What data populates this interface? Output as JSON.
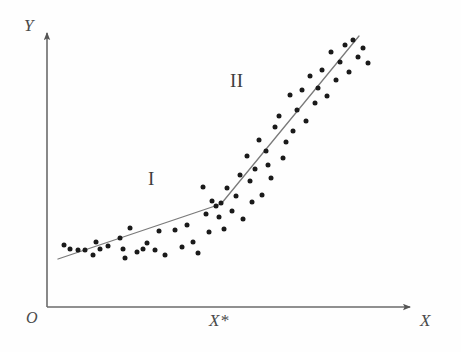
{
  "figure": {
    "background_color": "#fefefe",
    "ink_color": "#3d3d3d",
    "point_color": "#1a1a1a",
    "line_color": "#7a7a7a",
    "axis_color": "#6b6b6b"
  },
  "axes": {
    "y_label": "Y",
    "x_label": "X",
    "origin_label": "O",
    "breakpoint_label": "X*",
    "origin_px": {
      "x": 47,
      "y": 307
    },
    "x_axis_end_px": {
      "x": 415,
      "y": 307
    },
    "y_axis_top_px": {
      "x": 47,
      "y": 28
    }
  },
  "regions": {
    "first": {
      "label": "I",
      "x": 152,
      "y": 180
    },
    "second": {
      "label": "II",
      "x": 237,
      "y": 82
    }
  },
  "chart_data": {
    "type": "scatter",
    "xlabel": "X",
    "ylabel": "Y",
    "grid": false,
    "legend": false,
    "axis_style": "arrow-axes-from-origin",
    "annotations": [
      {
        "text": "I",
        "x": 152,
        "y": 180,
        "meaning": "regime-one-shallow-slope"
      },
      {
        "text": "II",
        "x": 237,
        "y": 82,
        "meaning": "regime-two-steep-slope"
      },
      {
        "text": "X*",
        "x": 219,
        "y": 318,
        "meaning": "breakpoint-on-x-axis"
      }
    ],
    "fit_line": {
      "type": "piecewise-linear",
      "breakpoint_px": {
        "x": 221,
        "y": 204
      },
      "segments": [
        {
          "name": "I",
          "from_px": {
            "x": 58,
            "y": 259
          },
          "to_px": {
            "x": 221,
            "y": 204
          },
          "slope_sign": "shallow-positive"
        },
        {
          "name": "II",
          "from_px": {
            "x": 221,
            "y": 204
          },
          "to_px": {
            "x": 359,
            "y": 36
          },
          "slope_sign": "steep-positive"
        }
      ]
    },
    "points_px": [
      [
        64,
        245
      ],
      [
        70,
        249
      ],
      [
        78,
        250
      ],
      [
        85,
        250
      ],
      [
        93,
        255
      ],
      [
        96,
        242
      ],
      [
        100,
        249
      ],
      [
        108,
        246
      ],
      [
        120,
        238
      ],
      [
        123,
        249
      ],
      [
        125,
        258
      ],
      [
        130,
        228
      ],
      [
        137,
        252
      ],
      [
        143,
        249
      ],
      [
        147,
        243
      ],
      [
        155,
        250
      ],
      [
        159,
        231
      ],
      [
        165,
        255
      ],
      [
        175,
        230
      ],
      [
        182,
        247
      ],
      [
        187,
        225
      ],
      [
        193,
        242
      ],
      [
        198,
        253
      ],
      [
        203,
        187
      ],
      [
        206,
        214
      ],
      [
        209,
        232
      ],
      [
        212,
        201
      ],
      [
        216,
        206
      ],
      [
        219,
        217
      ],
      [
        221,
        203
      ],
      [
        224,
        229
      ],
      [
        227,
        188
      ],
      [
        232,
        211
      ],
      [
        236,
        196
      ],
      [
        240,
        175
      ],
      [
        243,
        219
      ],
      [
        247,
        156
      ],
      [
        250,
        181
      ],
      [
        252,
        202
      ],
      [
        255,
        169
      ],
      [
        259,
        140
      ],
      [
        262,
        195
      ],
      [
        266,
        151
      ],
      [
        268,
        165
      ],
      [
        271,
        178
      ],
      [
        275,
        127
      ],
      [
        279,
        116
      ],
      [
        283,
        158
      ],
      [
        286,
        142
      ],
      [
        290,
        95
      ],
      [
        293,
        131
      ],
      [
        297,
        110
      ],
      [
        302,
        90
      ],
      [
        306,
        121
      ],
      [
        310,
        76
      ],
      [
        315,
        103
      ],
      [
        318,
        88
      ],
      [
        322,
        70
      ],
      [
        327,
        96
      ],
      [
        331,
        52
      ],
      [
        336,
        80
      ],
      [
        340,
        62
      ],
      [
        345,
        45
      ],
      [
        349,
        72
      ],
      [
        353,
        40
      ],
      [
        358,
        57
      ],
      [
        363,
        48
      ],
      [
        368,
        63
      ]
    ]
  }
}
